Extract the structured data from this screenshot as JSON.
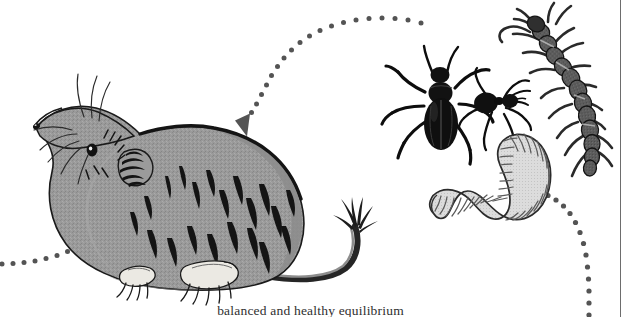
{
  "figure": {
    "caption": "balanced and healthy equilibrium",
    "background_color": "#ffffff",
    "border_color": "#6d6d6d"
  },
  "palette": {
    "fur_gray": "#9a9a9a",
    "fur_shadow": "#7d7d7d",
    "fur_light": "#b4b4b4",
    "ink_black": "#111111",
    "outline": "#1a1a1a",
    "worm_fill": "#d9d9d9",
    "worm_line": "#4a4a4a",
    "centipede_fill": "#5a5a5a",
    "centipede_dark": "#2a2a2a",
    "foot_pale": "#e8e6e0",
    "dot_gray": "#545454"
  },
  "organisms": [
    {
      "id": "shrew",
      "name": "shrew",
      "label": "shrew",
      "role": "predator",
      "position": "left"
    },
    {
      "id": "beetle",
      "name": "ground-beetle",
      "label": "ground beetle",
      "role": "prey",
      "position": "upper-right"
    },
    {
      "id": "ant",
      "name": "ant",
      "label": "ant",
      "role": "prey",
      "position": "upper-right"
    },
    {
      "id": "centipede",
      "name": "centipede",
      "label": "centipede",
      "role": "prey",
      "position": "top-right"
    },
    {
      "id": "earthworm",
      "name": "earthworm",
      "label": "earthworm",
      "role": "prey",
      "position": "right"
    }
  ],
  "arrows": [
    {
      "id": "arrow-to-shrew",
      "name": "dotted-arrow-to-shrew",
      "style": "dotted",
      "direction": "down-left",
      "from": "prey-group",
      "to": "shrew",
      "has_arrowhead": true
    },
    {
      "id": "arrow-to-prey",
      "name": "dotted-arrow-to-prey",
      "style": "dotted",
      "direction": "up-left",
      "from": "bottom",
      "to": "earthworm",
      "has_arrowhead": true
    },
    {
      "id": "trail-left",
      "name": "dotted-trail-left",
      "style": "dotted",
      "direction": "left",
      "from": "shrew",
      "to": "off-frame",
      "has_arrowhead": false
    }
  ]
}
